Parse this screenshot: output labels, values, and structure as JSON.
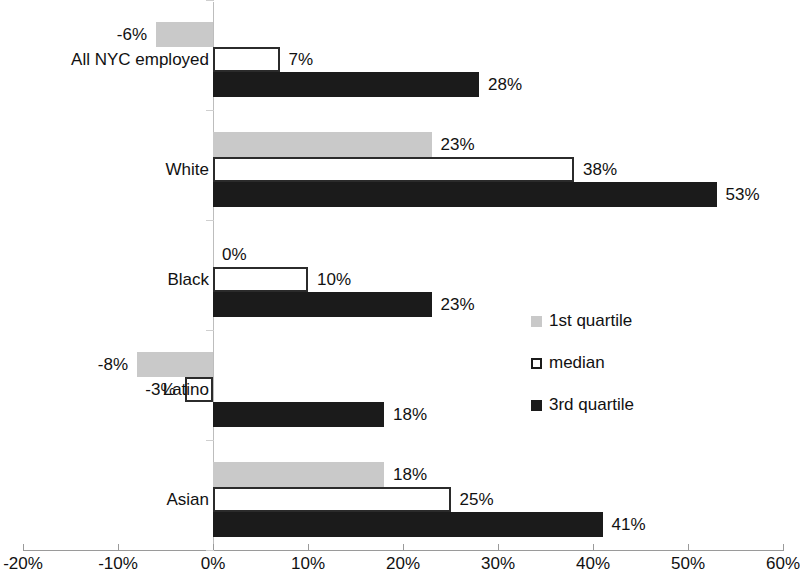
{
  "chart_data": {
    "type": "bar",
    "orientation": "horizontal",
    "title": "",
    "subtitle": "",
    "xlabel": "",
    "ylabel": "",
    "xlim": [
      -20,
      60
    ],
    "xtick_values": [
      -20,
      -10,
      0,
      10,
      20,
      30,
      40,
      50,
      60
    ],
    "xtick_labels": [
      "-20%",
      "-10%",
      "0%",
      "10%",
      "20%",
      "30%",
      "40%",
      "50%",
      "60%"
    ],
    "grid": false,
    "legend_position": "center-right",
    "categories": [
      "All NYC employed",
      "White",
      "Black",
      "Latino",
      "Asian"
    ],
    "series": [
      {
        "name": "1st quartile",
        "color": "#c9c9c9",
        "values": [
          -6,
          23,
          0,
          -8,
          18
        ],
        "labels": [
          "-6%",
          "23%",
          "0%",
          "-8%",
          "18%"
        ]
      },
      {
        "name": "median",
        "color": "#ffffff",
        "values": [
          7,
          38,
          10,
          -3,
          25
        ],
        "labels": [
          "7%",
          "38%",
          "10%",
          "-3%",
          "25%"
        ]
      },
      {
        "name": "3rd quartile",
        "color": "#1b1b1b",
        "values": [
          28,
          53,
          23,
          18,
          41
        ],
        "labels": [
          "28%",
          "53%",
          "23%",
          "18%",
          "41%"
        ]
      }
    ]
  },
  "legend": {
    "items": [
      {
        "label": "1st quartile",
        "swatch": "q1"
      },
      {
        "label": "median",
        "swatch": "med"
      },
      {
        "label": "3rd quartile",
        "swatch": "q3"
      }
    ]
  },
  "axis": {
    "zero_label": "0%",
    "min_label": "-20%",
    "max_label": "60%"
  }
}
